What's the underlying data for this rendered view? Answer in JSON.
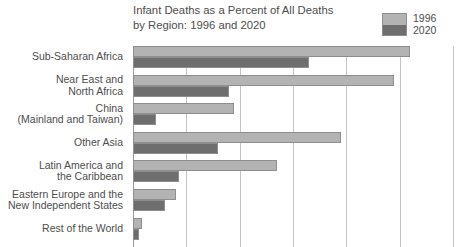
{
  "chart_data": {
    "type": "bar",
    "orientation": "horizontal",
    "title": "Infant Deaths as a Percent of All Deaths\nby Region:  1996 and 2020",
    "xlabel": "",
    "ylabel": "",
    "xlim": [
      0,
      30
    ],
    "grid": true,
    "gridline_values": [
      5,
      10,
      15,
      20,
      25,
      30
    ],
    "legend_position": "top-right",
    "legend": [
      "1996",
      "2020"
    ],
    "colors": {
      "series_1996": "#b3b3b3",
      "series_2020": "#6e6e6e",
      "gridline": "#c4c4c4",
      "axis": "#9a9a9a",
      "text": "#4d4d4d",
      "bar_border": "#8e8e8e"
    },
    "categories": [
      "Sub-Saharan Africa",
      "Near East and\nNorth Africa",
      "China\n(Mainland and Taiwan)",
      "Other Asia",
      "Latin America and\nthe Caribbean",
      "Eastern Europe and the\nNew Independent States",
      "Rest of the World"
    ],
    "series": [
      {
        "name": "1996",
        "color": "#b3b3b3",
        "values": [
          26.0,
          24.5,
          9.5,
          19.5,
          13.5,
          4.0,
          0.8
        ]
      },
      {
        "name": "2020",
        "color": "#6e6e6e",
        "values": [
          16.5,
          9.0,
          2.2,
          8.0,
          4.3,
          3.0,
          0.6
        ]
      }
    ],
    "note": "bottom row partially cropped in view"
  }
}
